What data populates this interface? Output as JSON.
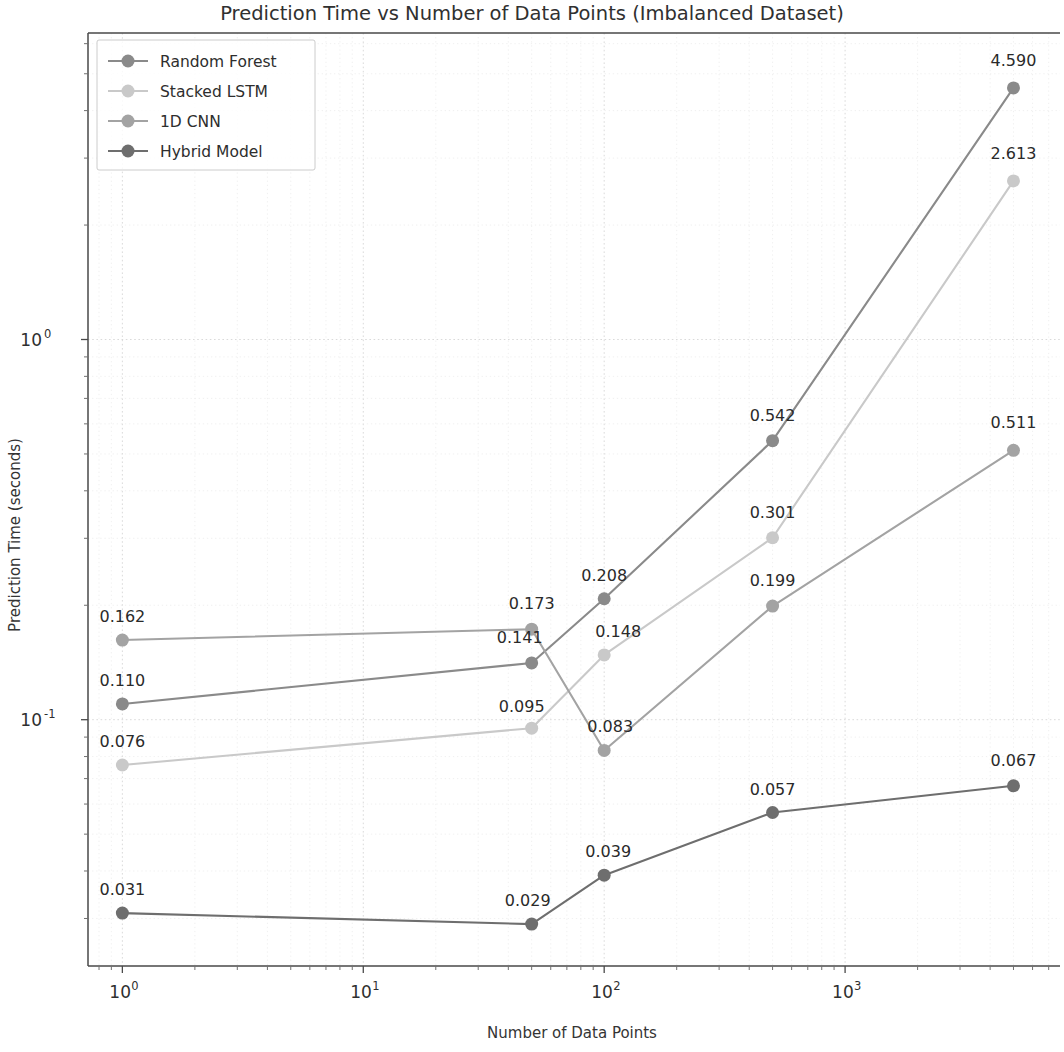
{
  "chart_data": {
    "type": "line",
    "title": "Prediction Time vs Number of Data Points (Imbalanced Dataset)",
    "xlabel": "Number of Data Points",
    "ylabel": "Prediction Time (seconds)",
    "xscale": "log",
    "yscale": "log",
    "grid": true,
    "legend_position": "upper left",
    "xlim": [
      0.72,
      7800
    ],
    "ylim": [
      0.0225,
      6.4
    ],
    "x": [
      1,
      50,
      100,
      500,
      5000
    ],
    "xtick_labels": [
      "10^0",
      "10^1",
      "10^2",
      "10^3"
    ],
    "xtick_values": [
      1,
      10,
      100,
      1000
    ],
    "ytick_labels": [
      "10^0",
      "10^-1"
    ],
    "ytick_values": [
      1,
      0.1
    ],
    "series": [
      {
        "name": "Random Forest",
        "color": "#8a8a8a",
        "values": [
          0.11,
          0.141,
          0.208,
          0.542,
          4.59
        ],
        "labels": [
          "0.110",
          "0.141",
          "0.208",
          "0.542",
          "4.590"
        ]
      },
      {
        "name": "Stacked LSTM",
        "color": "#c9c9c9",
        "values": [
          0.076,
          0.095,
          0.148,
          0.301,
          2.613
        ],
        "labels": [
          "0.076",
          "0.095",
          "0.148",
          "0.301",
          "2.613"
        ]
      },
      {
        "name": "1D CNN",
        "color": "#a3a3a3",
        "values": [
          0.162,
          0.173,
          0.083,
          0.199,
          0.511
        ],
        "labels": [
          "0.162",
          "0.173",
          "0.083",
          "0.199",
          "0.511"
        ]
      },
      {
        "name": "Hybrid Model",
        "color": "#6e6e6e",
        "values": [
          0.031,
          0.029,
          0.039,
          0.057,
          0.067
        ],
        "labels": [
          "0.031",
          "0.029",
          "0.039",
          "0.057",
          "0.067"
        ]
      }
    ]
  }
}
